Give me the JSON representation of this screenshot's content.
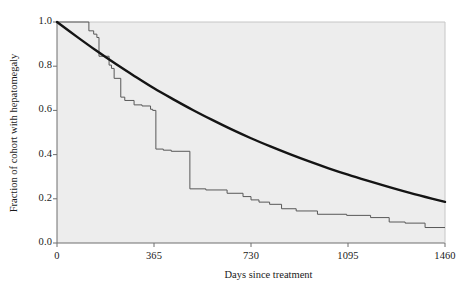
{
  "chart_data": {
    "type": "line",
    "title": "",
    "xlabel": "Days since treatment",
    "ylabel": "Fraction of cohort with hepatomegaly",
    "xlim": [
      0,
      1460
    ],
    "ylim": [
      0.0,
      1.0
    ],
    "xticks": [
      0,
      365,
      730,
      1095,
      1460
    ],
    "xtick_labels": [
      "0",
      "365",
      "730",
      "1095",
      "1460"
    ],
    "yticks": [
      0.0,
      0.2,
      0.4,
      0.6,
      0.8,
      1.0
    ],
    "ytick_labels": [
      "0.0",
      "0.2",
      "0.4",
      "0.6",
      "0.8",
      "1.0"
    ],
    "grid": false,
    "legend": "none",
    "plot_background": "#ededed",
    "frame_color": "#6e6e6e",
    "series": [
      {
        "name": "Kaplan-Meier step estimate",
        "type": "step",
        "color": "#585858",
        "linewidth": 1,
        "x": [
          0,
          120,
          120,
          138,
          138,
          150,
          150,
          158,
          158,
          196,
          196,
          205,
          205,
          215,
          215,
          240,
          240,
          255,
          255,
          290,
          290,
          320,
          320,
          352,
          352,
          360,
          360,
          372,
          372,
          400,
          400,
          430,
          430,
          500,
          500,
          560,
          560,
          640,
          640,
          700,
          700,
          730,
          730,
          760,
          760,
          800,
          800,
          845,
          845,
          900,
          900,
          980,
          980,
          1090,
          1090,
          1180,
          1180,
          1250,
          1250,
          1310,
          1310,
          1385,
          1385,
          1460
        ],
        "y": [
          1.0,
          1.0,
          0.96,
          0.96,
          0.945,
          0.945,
          0.93,
          0.93,
          0.845,
          0.845,
          0.805,
          0.805,
          0.79,
          0.79,
          0.745,
          0.745,
          0.66,
          0.66,
          0.645,
          0.645,
          0.625,
          0.625,
          0.62,
          0.62,
          0.605,
          0.605,
          0.6,
          0.6,
          0.425,
          0.425,
          0.42,
          0.42,
          0.415,
          0.415,
          0.245,
          0.245,
          0.24,
          0.24,
          0.225,
          0.225,
          0.21,
          0.21,
          0.195,
          0.195,
          0.185,
          0.185,
          0.175,
          0.175,
          0.155,
          0.155,
          0.145,
          0.145,
          0.13,
          0.13,
          0.125,
          0.125,
          0.115,
          0.115,
          0.095,
          0.095,
          0.09,
          0.09,
          0.07,
          0.07
        ]
      },
      {
        "name": "Fitted exponential model",
        "type": "smooth",
        "color": "#141414",
        "linewidth": 2.4,
        "model": "exponential-decay",
        "x": [
          0,
          73,
          146,
          219,
          292,
          365,
          438,
          511,
          584,
          657,
          730,
          803,
          876,
          949,
          1022,
          1095,
          1168,
          1241,
          1314,
          1387,
          1460
        ],
        "y": [
          1.0,
          0.935,
          0.872,
          0.812,
          0.755,
          0.7,
          0.65,
          0.602,
          0.557,
          0.514,
          0.474,
          0.437,
          0.402,
          0.369,
          0.338,
          0.309,
          0.282,
          0.256,
          0.231,
          0.208,
          0.186
        ]
      }
    ]
  },
  "axes": {
    "x_title": "Days since treatment",
    "y_title": "Fraction of cohort with hepatomegaly"
  }
}
